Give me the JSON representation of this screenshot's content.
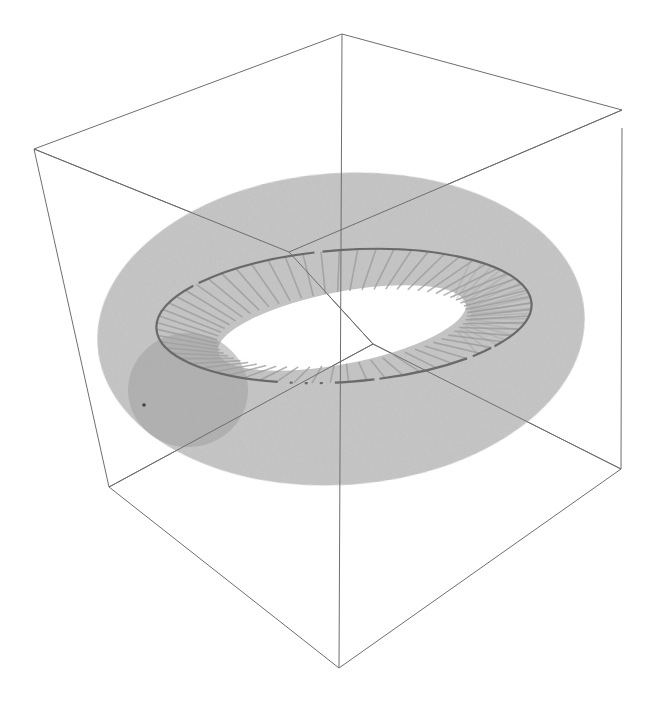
{
  "figure": {
    "colors": {
      "background": "#ffffff",
      "box_edge": "#6e6e6e",
      "torus_fill": "#c4c4c4",
      "ring_line": "#6a6a6a",
      "radial_lines": "#9a9a9a",
      "cross_section": "#a8a8a8"
    },
    "box": {
      "vertices": {
        "top_left": [
          34,
          149
        ],
        "top": [
          342,
          34
        ],
        "top_right": [
          622,
          110
        ],
        "top_back": [
          289,
          252
        ],
        "bottom_left": [
          109,
          487
        ],
        "bottom": [
          339,
          668
        ],
        "bottom_right": [
          621,
          469
        ],
        "bottom_back": [
          373,
          344
        ]
      }
    },
    "torus": {
      "outer": {
        "cx": 341,
        "cy": 329,
        "rx": 244,
        "ry": 156,
        "rotate": -4
      },
      "hole": {
        "cx": 342,
        "cy": 328,
        "rx": 126,
        "ry": 36,
        "rotate": -7
      },
      "core_ring": {
        "cx": 344,
        "cy": 316,
        "rx": 188,
        "ry": 66,
        "rotate": -4
      },
      "cross_section": {
        "cx": 188,
        "cy": 390,
        "rx": 60,
        "ry": 57
      }
    }
  }
}
